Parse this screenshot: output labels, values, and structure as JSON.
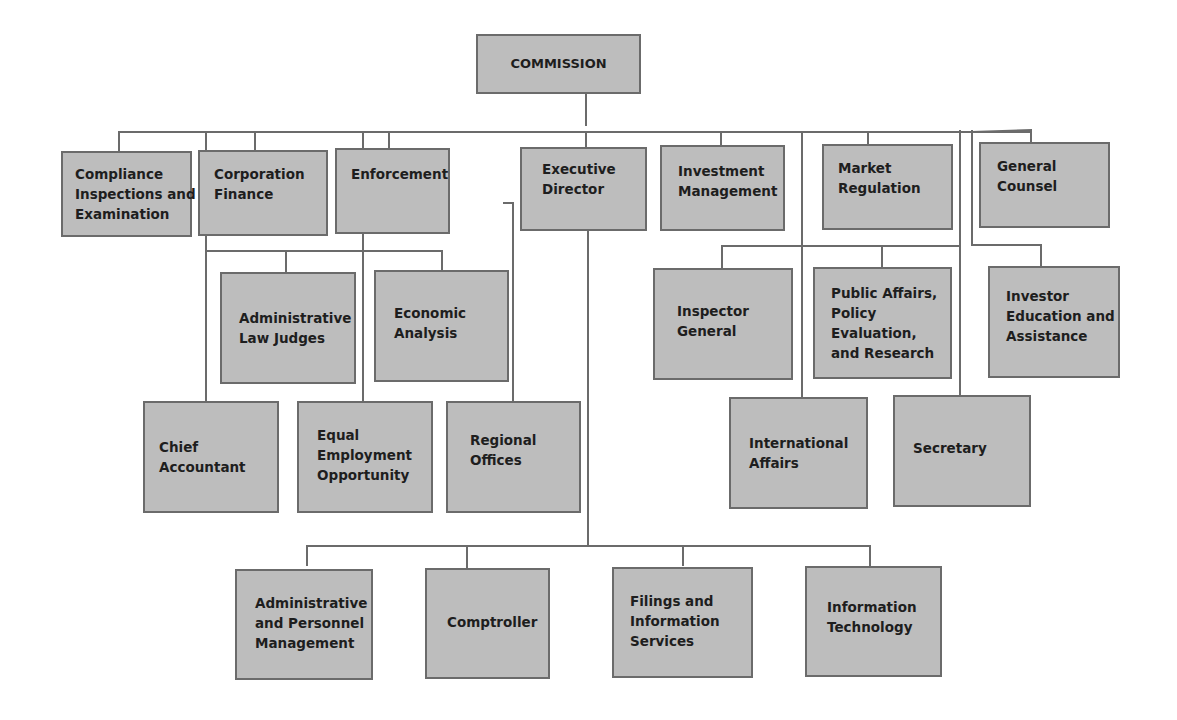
{
  "diagram": {
    "type": "organization-chart",
    "colors": {
      "box_fill": "#bdbdbd",
      "box_border": "#6b6b6b",
      "connector": "#6b6b6b",
      "text": "#1e1e1e"
    },
    "root": {
      "id": "commission",
      "lines": [
        "COMMISSION"
      ]
    },
    "nodes": [
      {
        "id": "compliance",
        "lines": [
          "Compliance",
          "Inspections and",
          "Examination"
        ]
      },
      {
        "id": "corp-finance",
        "lines": [
          "Corporation",
          "Finance"
        ]
      },
      {
        "id": "enforcement",
        "lines": [
          "Enforcement"
        ]
      },
      {
        "id": "exec-director",
        "lines": [
          "Executive",
          "Director"
        ]
      },
      {
        "id": "investment-mgmt",
        "lines": [
          "Investment",
          "Management"
        ]
      },
      {
        "id": "market-reg",
        "lines": [
          "Market",
          "Regulation"
        ]
      },
      {
        "id": "general-counsel",
        "lines": [
          "General",
          "Counsel"
        ]
      },
      {
        "id": "admin-law-judges",
        "lines": [
          "Administrative",
          "Law Judges"
        ]
      },
      {
        "id": "economic-analysis",
        "lines": [
          "Economic",
          "Analysis"
        ]
      },
      {
        "id": "inspector-general",
        "lines": [
          "Inspector",
          "General"
        ]
      },
      {
        "id": "public-affairs",
        "lines": [
          "Public Affairs,",
          "Policy",
          "Evaluation,",
          "and Research"
        ]
      },
      {
        "id": "investor-education",
        "lines": [
          "Investor",
          "Education and",
          "Assistance"
        ]
      },
      {
        "id": "chief-accountant",
        "lines": [
          "Chief",
          "Accountant"
        ]
      },
      {
        "id": "equal-employment",
        "lines": [
          "Equal",
          "Employment",
          "Opportunity"
        ]
      },
      {
        "id": "regional-offices",
        "lines": [
          "Regional",
          "Offices"
        ]
      },
      {
        "id": "international-affairs",
        "lines": [
          "International",
          "Affairs"
        ]
      },
      {
        "id": "secretary",
        "lines": [
          "Secretary"
        ]
      },
      {
        "id": "admin-personnel",
        "lines": [
          "Administrative",
          "and Personnel",
          "Management"
        ]
      },
      {
        "id": "comptroller",
        "lines": [
          "Comptroller"
        ]
      },
      {
        "id": "filings-info",
        "lines": [
          "Filings and",
          "Information",
          "Services"
        ]
      },
      {
        "id": "info-tech",
        "lines": [
          "Information",
          "Technology"
        ]
      }
    ],
    "edges": [
      [
        "commission",
        "compliance"
      ],
      [
        "commission",
        "corp-finance"
      ],
      [
        "commission",
        "enforcement"
      ],
      [
        "commission",
        "exec-director"
      ],
      [
        "commission",
        "investment-mgmt"
      ],
      [
        "commission",
        "market-reg"
      ],
      [
        "commission",
        "general-counsel"
      ],
      [
        "commission",
        "admin-law-judges"
      ],
      [
        "commission",
        "economic-analysis"
      ],
      [
        "commission",
        "inspector-general"
      ],
      [
        "commission",
        "public-affairs"
      ],
      [
        "commission",
        "investor-education"
      ],
      [
        "commission",
        "chief-accountant"
      ],
      [
        "commission",
        "equal-employment"
      ],
      [
        "commission",
        "international-affairs"
      ],
      [
        "commission",
        "secretary"
      ],
      [
        "enforcement",
        "regional-offices"
      ],
      [
        "exec-director",
        "admin-personnel"
      ],
      [
        "exec-director",
        "comptroller"
      ],
      [
        "exec-director",
        "filings-info"
      ],
      [
        "exec-director",
        "info-tech"
      ]
    ]
  }
}
